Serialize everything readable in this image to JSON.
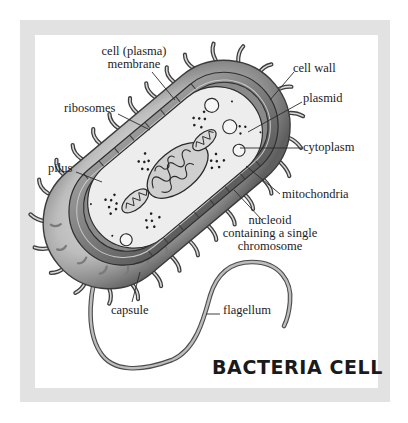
{
  "title": "BACTERIA CELL",
  "colors": {
    "frame": "#e2e2e2",
    "panel": "#ffffff",
    "ink": "#1c1c1c",
    "capsule_dark": "#5a5a5a",
    "capsule_light": "#e6e6e6",
    "wall": "#7d7d7d",
    "cytoplasm": "#ececec"
  },
  "labels": {
    "cell_membrane_line1": "cell (plasma)",
    "cell_membrane_line2": "membrane",
    "cell_wall": "cell wall",
    "plasmid": "plasmid",
    "ribosomes": "ribosomes",
    "cytoplasm": "cytoplasm",
    "pilus": "pilus",
    "mitochondria": "mitochondria",
    "nucleoid_line1": "nucleoid",
    "nucleoid_line2": "containing a single",
    "nucleoid_line3": "chromosome",
    "capsule": "capsule",
    "flagellum": "flagellum"
  }
}
